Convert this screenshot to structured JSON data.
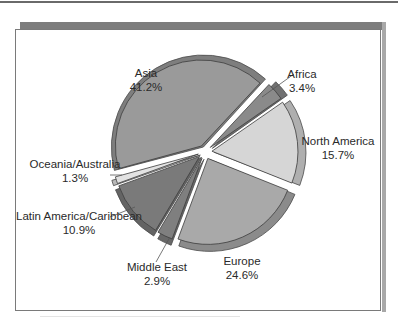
{
  "chart_data": {
    "type": "pie",
    "title": "",
    "style": "exploded 3D pie",
    "categories": [
      "Africa",
      "North America",
      "Europe",
      "Middle East",
      "Latin America/Caribbean",
      "Oceania/Australia",
      "Asia"
    ],
    "values": [
      3.4,
      15.7,
      24.6,
      2.9,
      10.9,
      1.3,
      41.2
    ],
    "unit": "%",
    "start_angle_deg": -47,
    "direction": "clockwise",
    "colors": {
      "Africa": "#8a8a8a",
      "North America": "#d6d6d6",
      "Europe": "#a9a9a9",
      "Middle East": "#7f7f7f",
      "Latin America/Caribbean": "#7a7a7a",
      "Oceania/Australia": "#e2e2e2",
      "Asia": "#9a9a9a"
    },
    "labels": [
      {
        "name": "Africa",
        "value": "3.4%",
        "x": 302,
        "y": 78,
        "leader": [
          [
            262,
            97
          ],
          [
            294,
            74
          ]
        ]
      },
      {
        "name": "North America",
        "value": "15.7%",
        "x": 338,
        "y": 145,
        "leader": null
      },
      {
        "name": "Europe",
        "value": "24.6%",
        "x": 242,
        "y": 265,
        "leader": null
      },
      {
        "name": "Middle East",
        "value": "2.9%",
        "x": 157,
        "y": 271,
        "leader": [
          [
            170,
            237
          ],
          [
            156,
            262
          ]
        ]
      },
      {
        "name": "Latin America/Caribbean",
        "value": "10.9%",
        "x": 79,
        "y": 220,
        "leader": [
          [
            135,
            207
          ],
          [
            110,
            217
          ]
        ]
      },
      {
        "name": "Oceania/Australia",
        "value": "1.3%",
        "x": 75,
        "y": 168,
        "leader": [
          [
            122,
            175
          ],
          [
            110,
            175
          ]
        ]
      },
      {
        "name": "Asia",
        "value": "41.2%",
        "x": 146,
        "y": 77,
        "leader": null
      }
    ]
  }
}
